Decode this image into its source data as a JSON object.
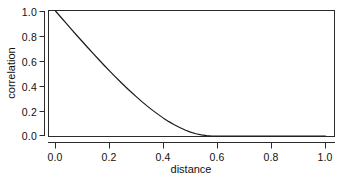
{
  "chart_data": {
    "type": "line",
    "title": "",
    "xlabel": "distance",
    "ylabel": "correlation",
    "xlim": [
      0.0,
      1.0
    ],
    "ylim": [
      0.0,
      1.0
    ],
    "grid": false,
    "legend": null,
    "xticks": [
      "0.0",
      "0.2",
      "0.4",
      "0.6",
      "0.8",
      "1.0"
    ],
    "xtick_values": [
      0.0,
      0.2,
      0.4,
      0.6,
      0.8,
      1.0
    ],
    "yticks": [
      "0.0",
      "0.2",
      "0.4",
      "0.6",
      "0.8",
      "1.0"
    ],
    "ytick_values": [
      0.0,
      0.2,
      0.4,
      0.6,
      0.8,
      1.0
    ],
    "series": [
      {
        "name": "correlation",
        "color": "#1a1a1a",
        "x": [
          0.0,
          0.02,
          0.04,
          0.06,
          0.08,
          0.1,
          0.12,
          0.14,
          0.16,
          0.18,
          0.2,
          0.22,
          0.24,
          0.26,
          0.28,
          0.3,
          0.32,
          0.34,
          0.36,
          0.38,
          0.4,
          0.42,
          0.44,
          0.46,
          0.48,
          0.5,
          0.52,
          0.54,
          0.56,
          0.58,
          0.6,
          0.65,
          0.7,
          0.75,
          0.8,
          0.85,
          0.9,
          0.95,
          1.0
        ],
        "y": [
          1.0,
          0.95,
          0.901,
          0.851,
          0.802,
          0.754,
          0.706,
          0.659,
          0.612,
          0.566,
          0.521,
          0.477,
          0.434,
          0.392,
          0.352,
          0.313,
          0.275,
          0.239,
          0.205,
          0.173,
          0.143,
          0.115,
          0.09,
          0.068,
          0.048,
          0.031,
          0.018,
          0.009,
          0.003,
          0.0,
          0.0,
          0.0,
          0.0,
          0.0,
          0.0,
          0.0,
          0.0,
          0.0,
          0.0
        ]
      }
    ],
    "annotations": []
  },
  "axes": {
    "frame_color": "#2b2b2b",
    "tick_color": "#2b2b2b",
    "background": "#ffffff"
  }
}
